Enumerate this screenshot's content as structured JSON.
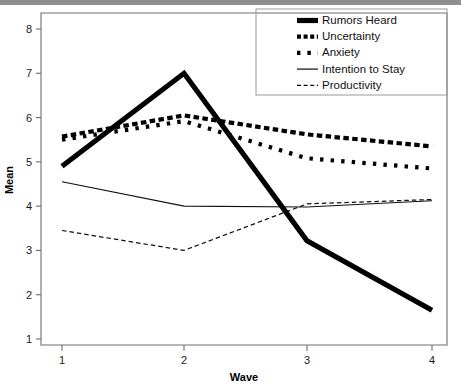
{
  "chart_data": {
    "type": "line",
    "title": "",
    "xlabel": "Wave",
    "ylabel": "Mean",
    "x": [
      1,
      2,
      3,
      4
    ],
    "categories": [
      "1",
      "2",
      "3",
      "4"
    ],
    "xtick_labels": [
      "1",
      "2",
      "3",
      "4"
    ],
    "ytick_labels": [
      "1",
      "2",
      "3",
      "4",
      "5",
      "6",
      "7",
      "8"
    ],
    "yticks": [
      1,
      2,
      3,
      4,
      5,
      6,
      7,
      8
    ],
    "xlim": [
      1,
      4
    ],
    "ylim": [
      0.7,
      8.3
    ],
    "grid": false,
    "legend_position": "top-right",
    "series": [
      {
        "name": "Rumors Heard",
        "style": "thick-solid",
        "values": [
          4.9,
          7.0,
          3.22,
          1.65
        ]
      },
      {
        "name": "Uncertainty",
        "style": "dense-dotted",
        "values": [
          5.57,
          6.05,
          5.62,
          5.35
        ]
      },
      {
        "name": "Anxiety",
        "style": "sparse-dotted",
        "values": [
          5.5,
          5.92,
          5.08,
          4.85
        ]
      },
      {
        "name": "Intention to Stay",
        "style": "thin-solid",
        "values": [
          4.55,
          4.0,
          3.98,
          4.12
        ]
      },
      {
        "name": "Productivity",
        "style": "dashed",
        "values": [
          3.45,
          3.0,
          4.05,
          4.15
        ]
      }
    ]
  },
  "legend": {
    "items": [
      {
        "label": "Rumors Heard",
        "swatch": "thick-solid-swatch"
      },
      {
        "label": "Uncertainty",
        "swatch": "dense-dotted-swatch"
      },
      {
        "label": "Anxiety",
        "swatch": "sparse-dotted-swatch"
      },
      {
        "label": "Intention to Stay",
        "swatch": "thin-solid-swatch"
      },
      {
        "label": "Productivity",
        "swatch": "dashed-swatch"
      }
    ]
  },
  "axes": {
    "y_title": "Mean",
    "x_title": "Wave"
  },
  "colors": {
    "ink": "#000000",
    "frame": "#6f6f6f",
    "topbar": "#8f8f8f"
  }
}
